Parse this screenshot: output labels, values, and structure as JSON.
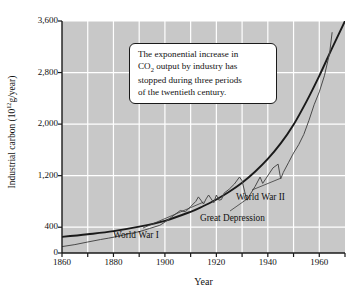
{
  "figure": {
    "background": "#ffffff",
    "plot_background": "#c8c8c8",
    "grid_color": "#ffffff",
    "axis_color": "#1a1a1a",
    "curve_color": "#1a1a1a",
    "data_line_color": "#4a4a4a"
  },
  "callout": {
    "line1_a": "The exponential increase in",
    "line2_a": "CO",
    "line2_sub": "2",
    "line2_b": " output by industry has",
    "line3": "stopped during three periods",
    "line4": "of the twentieth century."
  },
  "annotations": {
    "ww1": "World War I",
    "great_depression": "Great Depression",
    "ww2": "World War II"
  },
  "axis": {
    "ylabel_main": "Industrial carbon (10",
    "ylabel_exp": "12",
    "ylabel_tail": "g/year)",
    "xlabel": "Year"
  },
  "chart_data": {
    "type": "line",
    "title": "",
    "xlabel": "Year",
    "ylabel": "Industrial carbon (10^12 g/year)",
    "xlim": [
      1860,
      1970
    ],
    "ylim": [
      0,
      3600
    ],
    "xticks": [
      1860,
      1880,
      1900,
      1920,
      1940,
      1960
    ],
    "xtick_labels": [
      "1860",
      "1880",
      "1900",
      "1920",
      "1940",
      "1960"
    ],
    "xminor_ticks": [
      1870,
      1890,
      1910,
      1930,
      1950,
      1970
    ],
    "yticks": [
      0,
      400,
      1200,
      2000,
      2800,
      3600
    ],
    "ytick_labels": [
      "0",
      "400",
      "1,200",
      "2,000",
      "2,800",
      "3,600"
    ],
    "grid": true,
    "legend": "none",
    "series": [
      {
        "name": "Exponential trend",
        "style": "smooth-thick",
        "x": [
          1860,
          1870,
          1880,
          1890,
          1900,
          1910,
          1915,
          1920,
          1925,
          1930,
          1935,
          1940,
          1945,
          1950,
          1955,
          1960,
          1965,
          1970
        ],
        "values": [
          250,
          290,
          340,
          410,
          500,
          640,
          730,
          830,
          950,
          1090,
          1260,
          1460,
          1700,
          1990,
          2350,
          2750,
          3180,
          3600
        ]
      },
      {
        "name": "Actual industrial carbon output",
        "style": "jagged-thin",
        "x": [
          1860,
          1865,
          1870,
          1875,
          1878,
          1882,
          1886,
          1890,
          1894,
          1898,
          1900,
          1902,
          1904,
          1906,
          1908,
          1910,
          1912,
          1913,
          1914,
          1915,
          1916,
          1917,
          1918,
          1919,
          1920,
          1921,
          1922,
          1923,
          1925,
          1927,
          1929,
          1930,
          1931,
          1932,
          1933,
          1935,
          1937,
          1938,
          1940,
          1942,
          1944,
          1945,
          1946,
          1948,
          1950,
          1952,
          1954,
          1956,
          1958,
          1960,
          1962,
          1964,
          1965
        ],
        "values": [
          100,
          130,
          170,
          210,
          230,
          260,
          300,
          330,
          380,
          430,
          480,
          540,
          600,
          660,
          640,
          720,
          800,
          870,
          820,
          760,
          840,
          900,
          840,
          780,
          900,
          820,
          830,
          930,
          990,
          1070,
          1180,
          1120,
          950,
          820,
          900,
          1030,
          1180,
          1080,
          1200,
          1320,
          1380,
          1150,
          1250,
          1400,
          1550,
          1680,
          1840,
          2060,
          2300,
          2500,
          2750,
          3100,
          3420
        ]
      }
    ],
    "annotations": [
      {
        "text": "World War I",
        "points_to_year": 1915,
        "points_to_value": 760
      },
      {
        "text": "Great Depression",
        "points_to_year": 1932,
        "points_to_value": 820
      },
      {
        "text": "World War II",
        "points_to_year": 1945,
        "points_to_value": 1150
      }
    ]
  }
}
